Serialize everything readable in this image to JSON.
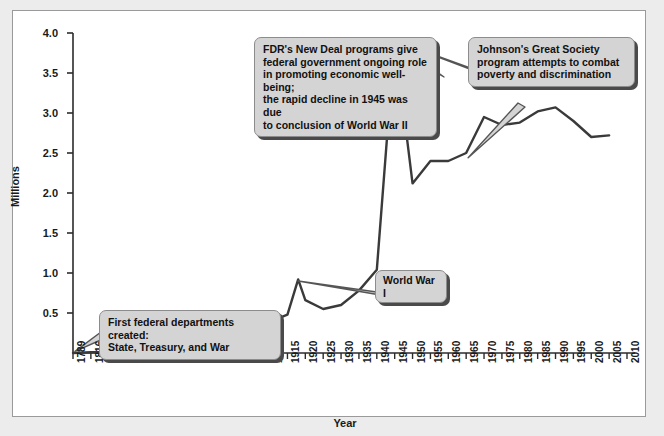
{
  "chart_data": {
    "type": "line",
    "title": "",
    "xlabel": "Year",
    "ylabel": "Millions",
    "ylim": [
      0,
      4.0
    ],
    "xlim": [
      1789,
      2010
    ],
    "grid": false,
    "legend": "none",
    "y_ticks": [
      "0.5",
      "1.0",
      "1.5",
      "2.0",
      "2.5",
      "3.0",
      "3.5",
      "4.0"
    ],
    "y_tick_values": [
      0.5,
      1.0,
      1.5,
      2.0,
      2.5,
      3.0,
      3.5,
      4.0
    ],
    "x_tick_labels": [
      "1789",
      "1816",
      "1821",
      "1831",
      "1841",
      "1851",
      "1861",
      "1871",
      "1881",
      "1891",
      "1901",
      "1910",
      "1915",
      "1920",
      "1925",
      "1930",
      "1935",
      "1940",
      "1945",
      "1950",
      "1955",
      "1960",
      "1965",
      "1970",
      "1975",
      "1980",
      "1985",
      "1990",
      "1995",
      "2000",
      "2005",
      "2010"
    ],
    "series": [
      {
        "name": "Federal civilian employment",
        "color": "#3a3a3a",
        "x": [
          1789,
          1816,
          1821,
          1831,
          1841,
          1851,
          1861,
          1871,
          1881,
          1891,
          1901,
          1910,
          1915,
          1918,
          1920,
          1925,
          1930,
          1935,
          1940,
          1945,
          1950,
          1955,
          1960,
          1965,
          1970,
          1975,
          1980,
          1985,
          1990,
          1995,
          2000,
          2005
        ],
        "values": [
          0.0,
          0.01,
          0.01,
          0.01,
          0.02,
          0.03,
          0.04,
          0.05,
          0.1,
          0.16,
          0.24,
          0.39,
          0.48,
          0.92,
          0.66,
          0.55,
          0.6,
          0.78,
          1.04,
          3.93,
          2.12,
          2.4,
          2.4,
          2.5,
          2.95,
          2.85,
          2.88,
          3.02,
          3.07,
          2.9,
          2.7,
          2.72
        ]
      }
    ],
    "annotations": [
      {
        "name": "first-departments",
        "text": "First federal departments created:\nState, Treasury, and War",
        "points_to_year": 1789,
        "points_to_value": 0.0
      },
      {
        "name": "world-war-i",
        "text": "World War I",
        "points_to_year": 1918,
        "points_to_value": 0.92
      },
      {
        "name": "fdr-new-deal",
        "text": "FDR's New Deal programs give federal government ongoing role in promoting economic well-being; the rapid decline in 1945 was due to conclusion of World War II",
        "points_to_year": 1945,
        "points_to_value": 3.93
      },
      {
        "name": "johnson-great-society",
        "text": "Johnson's Great Society program attempts to combat poverty and discrimination",
        "points_to_year": 1965,
        "points_to_value": 2.45
      }
    ]
  },
  "axis": {
    "y_label": "Millions",
    "x_label": "Year"
  },
  "callouts": {
    "first_departments": {
      "line1": "First federal departments created:",
      "line2": "State, Treasury, and War"
    },
    "world_war_i": {
      "line1": "World War I"
    },
    "fdr": {
      "line1": "FDR's New Deal programs give",
      "line2": "federal government ongoing role",
      "line3": "in promoting economic well-being;",
      "line4": "the rapid decline in 1945 was due",
      "line5": "to conclusion of World War II"
    },
    "johnson": {
      "line1": "Johnson's Great Society",
      "line2": "program attempts to combat",
      "line3": "poverty and discrimination"
    }
  },
  "colors": {
    "line": "#3a3a3a",
    "axis": "#2b2b2b",
    "callout_fill": "#d4d4d4",
    "callout_border": "#8c8c8c",
    "callout_shadow": "#4a4a4a",
    "panel_bg": "#ffffff",
    "page_bg": "#ececec"
  }
}
